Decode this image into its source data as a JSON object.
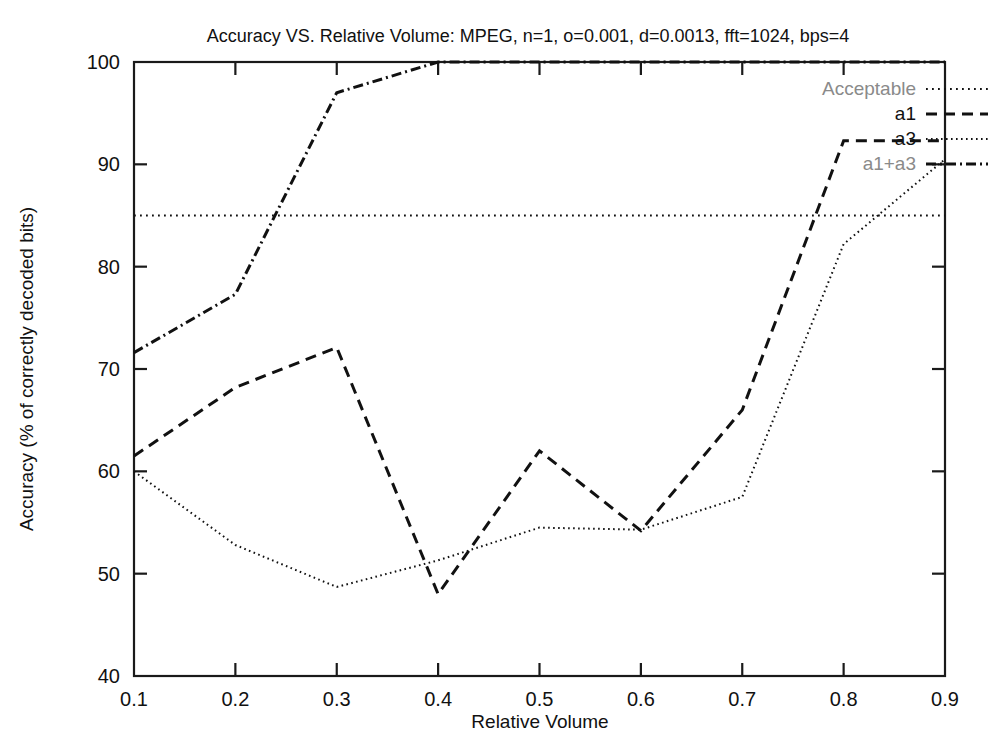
{
  "chart_data": {
    "type": "line",
    "title": "Accuracy VS. Relative Volume: MPEG, n=1, o=0.001, d=0.0013, fft=1024, bps=4",
    "xlabel": "Relative Volume",
    "ylabel": "Accuracy (% of correctly decoded bits)",
    "xlim": [
      0.1,
      0.9
    ],
    "ylim": [
      40,
      100
    ],
    "xticks": [
      "0.1",
      "0.2",
      "0.3",
      "0.4",
      "0.5",
      "0.6",
      "0.7",
      "0.8",
      "0.9"
    ],
    "xtick_values": [
      0.1,
      0.2,
      0.3,
      0.4,
      0.5,
      0.6,
      0.7,
      0.8,
      0.9
    ],
    "yticks": [
      "40",
      "50",
      "60",
      "70",
      "80",
      "90",
      "100"
    ],
    "ytick_values": [
      40,
      50,
      60,
      70,
      80,
      90,
      100
    ],
    "grid": false,
    "legend_position": "top-right",
    "x": [
      0.1,
      0.2,
      0.3,
      0.4,
      0.5,
      0.6,
      0.7,
      0.8,
      0.9
    ],
    "series": [
      {
        "name": "Acceptable",
        "style": "dotted",
        "dasharray": "1.8,4.2",
        "constant_value": 85,
        "values": [
          85,
          85,
          85,
          85,
          85,
          85,
          85,
          85,
          85
        ]
      },
      {
        "name": "a1",
        "style": "dashed",
        "dasharray": "11,7",
        "values": [
          61.5,
          68.2,
          72.1,
          48.0,
          62.0,
          54.2,
          66.0,
          92.3,
          92.3
        ]
      },
      {
        "name": "a3",
        "style": "fine-dotted",
        "dasharray": "1.6,3.4",
        "values": [
          60.0,
          52.8,
          48.7,
          51.3,
          54.5,
          54.3,
          57.5,
          82.2,
          90.5
        ]
      },
      {
        "name": "a1+a3",
        "style": "dash-dot",
        "dasharray": "10,4,2,4",
        "values": [
          71.6,
          77.3,
          97.0,
          100.0,
          100.0,
          100.0,
          100.0,
          100.0,
          100.0
        ]
      }
    ]
  },
  "legend": {
    "entries": [
      {
        "label": "Acceptable",
        "faded": true
      },
      {
        "label": "a1",
        "faded": false
      },
      {
        "label": "a3",
        "faded": false
      },
      {
        "label": "a1+a3",
        "faded": true
      }
    ]
  }
}
